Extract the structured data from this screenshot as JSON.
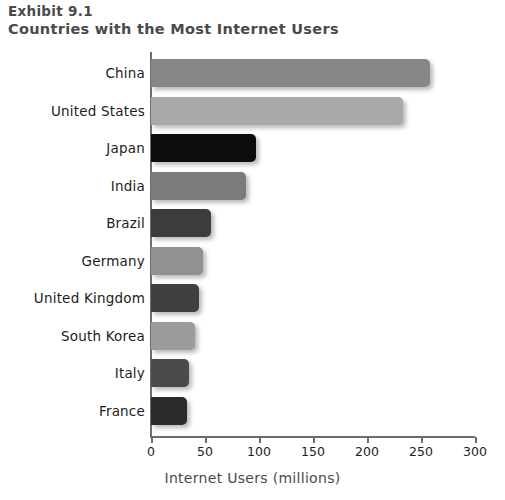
{
  "header": {
    "exhibit_number": "Exhibit 9.1",
    "title": "Countries with the Most Internet Users"
  },
  "axis": {
    "xlabel": "Internet Users (millions)",
    "ticks": [
      "0",
      "50",
      "100",
      "150",
      "200",
      "250",
      "300"
    ]
  },
  "chart_data": {
    "type": "bar",
    "orientation": "horizontal",
    "title": "Countries with the Most Internet Users",
    "subtitle": "Exhibit 9.1",
    "xlabel": "Internet Users (millions)",
    "ylabel": "",
    "xlim": [
      0,
      300
    ],
    "grid": false,
    "legend": false,
    "categories": [
      "China",
      "United States",
      "Japan",
      "India",
      "Brazil",
      "Germany",
      "United Kingdom",
      "South Korea",
      "Italy",
      "France"
    ],
    "values": [
      258,
      233,
      97,
      88,
      56,
      48,
      44,
      41,
      35,
      33
    ],
    "colors": [
      "#878787",
      "#a9a9a9",
      "#0d0d0d",
      "#7b7b7b",
      "#3c3c3c",
      "#919191",
      "#404040",
      "#9c9c9c",
      "#4b4b4b",
      "#2a2a2a"
    ],
    "xticks": [
      0,
      50,
      100,
      150,
      200,
      250,
      300
    ],
    "xticklabels": [
      "0",
      "50",
      "100",
      "150",
      "200",
      "250",
      "300"
    ]
  }
}
